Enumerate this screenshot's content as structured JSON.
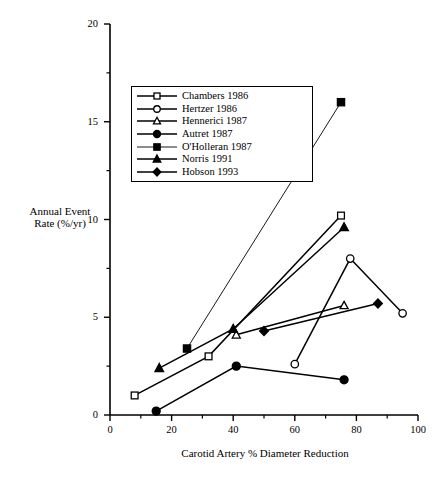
{
  "chart_data": {
    "type": "line",
    "title": "",
    "xlabel": "Carotid Artery % Diameter Reduction",
    "ylabel": "Annual Event Rate (%/yr)",
    "xlim": [
      0,
      100
    ],
    "ylim": [
      0,
      20
    ],
    "xticks": [
      0,
      20,
      40,
      60,
      80,
      100
    ],
    "yticks": [
      0,
      5,
      10,
      15,
      20
    ],
    "xminor": [
      10,
      30,
      50,
      70,
      90
    ],
    "yminor": [
      2.5,
      7.5,
      12.5,
      17.5
    ],
    "grid": false,
    "legend_position": "upper-left-inside",
    "series": [
      {
        "name": "Chambers 1986",
        "marker": "open-square",
        "x": [
          8,
          32,
          75
        ],
        "y": [
          1.0,
          3.0,
          10.2
        ]
      },
      {
        "name": "Hertzer 1986",
        "marker": "open-circle",
        "x": [
          60,
          78,
          95
        ],
        "y": [
          2.6,
          8.0,
          5.2
        ]
      },
      {
        "name": "Hennerici 1987",
        "marker": "open-triangle",
        "x": [
          41,
          76
        ],
        "y": [
          4.1,
          5.6
        ]
      },
      {
        "name": "Autret 1987",
        "marker": "filled-circle",
        "x": [
          15,
          41,
          76
        ],
        "y": [
          0.2,
          2.5,
          1.8
        ]
      },
      {
        "name": "O'Holleran 1987",
        "marker": "filled-square",
        "x": [
          25,
          75
        ],
        "y": [
          3.4,
          16.0
        ]
      },
      {
        "name": "Norris 1991",
        "marker": "filled-triangle",
        "x": [
          16,
          40,
          76
        ],
        "y": [
          2.4,
          4.4,
          9.6
        ]
      },
      {
        "name": "Hobson 1993",
        "marker": "filled-diamond",
        "x": [
          50,
          87
        ],
        "y": [
          4.3,
          5.7
        ]
      }
    ]
  },
  "legend": {
    "entries": [
      {
        "label": "Chambers 1986"
      },
      {
        "label": "Hertzer 1986"
      },
      {
        "label": "Hennerici 1987"
      },
      {
        "label": "Autret 1987"
      },
      {
        "label": "O'Holleran 1987"
      },
      {
        "label": "Norris 1991"
      },
      {
        "label": "Hobson 1993"
      }
    ]
  },
  "axes": {
    "y_title_line1": "Annual Event",
    "y_title_line2": "Rate (%/yr)",
    "x_title": "Carotid Artery % Diameter Reduction"
  }
}
